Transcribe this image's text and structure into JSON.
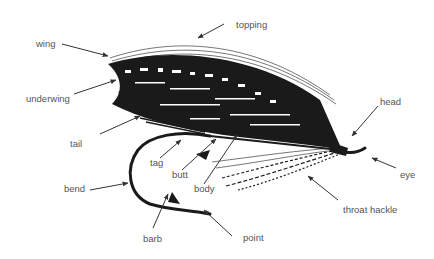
{
  "diagram": {
    "colors": {
      "ink": "#1a1a1a",
      "arrow": "#333333",
      "label": "#555555"
    },
    "labels": [
      {
        "id": "wing",
        "text": "wing",
        "x": 36,
        "y": 39
      },
      {
        "id": "topping",
        "text": "topping",
        "x": 236,
        "y": 20
      },
      {
        "id": "underwing",
        "text": "underwing",
        "x": 26,
        "y": 94
      },
      {
        "id": "head",
        "text": "head",
        "x": 380,
        "y": 97
      },
      {
        "id": "tail",
        "text": "tail",
        "x": 70,
        "y": 139
      },
      {
        "id": "tag",
        "text": "tag",
        "x": 150,
        "y": 158
      },
      {
        "id": "butt",
        "text": "butt",
        "x": 172,
        "y": 170
      },
      {
        "id": "body",
        "text": "body",
        "x": 194,
        "y": 184
      },
      {
        "id": "eye",
        "text": "eye",
        "x": 400,
        "y": 170
      },
      {
        "id": "bend",
        "text": "bend",
        "x": 64,
        "y": 184
      },
      {
        "id": "throat_hackle",
        "text": "throat hackle",
        "x": 343,
        "y": 205
      },
      {
        "id": "barb",
        "text": "barb",
        "x": 143,
        "y": 234
      },
      {
        "id": "point",
        "text": "point",
        "x": 243,
        "y": 233
      }
    ]
  }
}
